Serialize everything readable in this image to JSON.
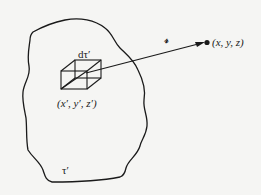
{
  "figure": {
    "colors": {
      "background": "#f5f5f3",
      "ink": "#1a1a1a"
    },
    "labels": {
      "volume_element": "dτ′",
      "source_point": "(x′, y′, z′)",
      "separation_vector": "𝓇",
      "field_point": "(x, y, z)",
      "source_volume": "τ′"
    },
    "shapes": {
      "region": "closed-irregular-blob",
      "element": "wireframe-cube",
      "vector": "arrow-from-element-to-field-point",
      "field_point_marker": "filled-dot"
    }
  }
}
